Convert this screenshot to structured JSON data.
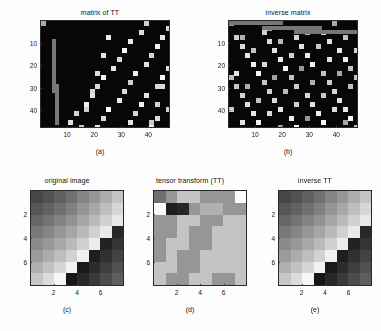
{
  "figure": {
    "background": "#fdfdfd",
    "panels": [
      {
        "id": "a",
        "title": "matrix of TT",
        "caption": "(a)"
      },
      {
        "id": "b",
        "title": "inverse matrix",
        "caption": "(b)"
      },
      {
        "id": "c",
        "title": "original image",
        "caption": "(c)"
      },
      {
        "id": "d",
        "title": "tensor transform (TT)",
        "caption": "(d)"
      },
      {
        "id": "e",
        "title": "inverse TT",
        "caption": "(e)"
      }
    ]
  },
  "chart_data": [
    {
      "type": "heatmap",
      "id": "a",
      "title": "matrix of TT",
      "caption": "(a)",
      "xlabel": "",
      "ylabel": "",
      "xticks": [
        10,
        20,
        30,
        40
      ],
      "yticks": [
        10,
        20,
        30,
        40
      ],
      "xlim": [
        0,
        48
      ],
      "ylim": [
        0,
        48
      ],
      "grid": false,
      "colormap": "gray",
      "background_value": 0,
      "description": "Sparse binary 48x48 transform matrix: bright dots on black background arranged in nested chevron / V-shaped diagonal bands, with a broken vertical gray streak down the left-most columns.",
      "size": [
        48,
        48
      ]
    },
    {
      "type": "heatmap",
      "id": "b",
      "title": "inverse matrix",
      "caption": "(b)",
      "xlabel": "",
      "ylabel": "",
      "xticks": [
        10,
        20,
        30,
        40
      ],
      "yticks": [
        10,
        20,
        30,
        40
      ],
      "xlim": [
        0,
        48
      ],
      "ylim": [
        0,
        48
      ],
      "grid": false,
      "colormap": "gray",
      "background_value": 0,
      "description": "Sparse 48x48 inverse transform matrix: descending staircase of horizontal gray bars across the top rows, repeated parallel diagonal dot stripes below, and a short bright vertical white line near column 43 at the bottom.",
      "size": [
        48,
        48
      ]
    },
    {
      "type": "heatmap",
      "id": "c",
      "title": "original image",
      "caption": "(c)",
      "xlabel": "",
      "ylabel": "",
      "xticks": [
        2,
        4,
        6
      ],
      "yticks": [
        2,
        4,
        6
      ],
      "xlim": [
        0,
        8
      ],
      "ylim": [
        0,
        8
      ],
      "grid": false,
      "colormap": "gray",
      "vmin": 0,
      "vmax": 255,
      "size": [
        8,
        8
      ],
      "values": [
        [
          70,
          82,
          96,
          112,
          132,
          150,
          172,
          196
        ],
        [
          86,
          98,
          112,
          128,
          148,
          168,
          190,
          214
        ],
        [
          102,
          116,
          130,
          146,
          166,
          186,
          208,
          232
        ],
        [
          120,
          134,
          150,
          166,
          186,
          208,
          234,
          40
        ],
        [
          138,
          152,
          168,
          186,
          208,
          236,
          34,
          52
        ],
        [
          156,
          172,
          190,
          210,
          240,
          30,
          48,
          66
        ],
        [
          176,
          194,
          214,
          242,
          26,
          44,
          62,
          80
        ],
        [
          198,
          220,
          246,
          22,
          40,
          58,
          76,
          94
        ]
      ]
    },
    {
      "type": "heatmap",
      "id": "d",
      "title": "tensor transform (TT)",
      "caption": "(d)",
      "xlabel": "",
      "ylabel": "",
      "xticks": [
        2,
        4,
        6
      ],
      "yticks": [
        2,
        4,
        6
      ],
      "xlim": [
        0,
        8
      ],
      "ylim": [
        0,
        8
      ],
      "grid": false,
      "colormap": "gray",
      "vmin": 0,
      "vmax": 255,
      "size": [
        8,
        8
      ],
      "values": [
        [
          112,
          150,
          196,
          196,
          150,
          150,
          150,
          252
        ],
        [
          250,
          30,
          38,
          150,
          176,
          176,
          150,
          150
        ],
        [
          150,
          150,
          196,
          196,
          150,
          150,
          196,
          196
        ],
        [
          150,
          150,
          196,
          150,
          150,
          196,
          196,
          196
        ],
        [
          150,
          196,
          196,
          150,
          150,
          196,
          196,
          196
        ],
        [
          150,
          196,
          150,
          150,
          196,
          196,
          196,
          196
        ],
        [
          196,
          196,
          150,
          150,
          196,
          196,
          196,
          196
        ],
        [
          196,
          150,
          150,
          196,
          196,
          150,
          150,
          196
        ]
      ]
    },
    {
      "type": "heatmap",
      "id": "e",
      "title": "inverse TT",
      "caption": "(e)",
      "xlabel": "",
      "ylabel": "",
      "xticks": [
        2,
        4,
        6
      ],
      "yticks": [
        2,
        4,
        6
      ],
      "xlim": [
        0,
        8
      ],
      "ylim": [
        0,
        8
      ],
      "grid": false,
      "colormap": "gray",
      "vmin": 0,
      "vmax": 255,
      "size": [
        8,
        8
      ],
      "values": [
        [
          70,
          82,
          96,
          112,
          132,
          150,
          172,
          196
        ],
        [
          86,
          98,
          112,
          128,
          148,
          168,
          190,
          214
        ],
        [
          102,
          116,
          130,
          146,
          166,
          186,
          208,
          232
        ],
        [
          120,
          134,
          150,
          166,
          186,
          208,
          234,
          40
        ],
        [
          138,
          152,
          168,
          186,
          208,
          236,
          34,
          52
        ],
        [
          156,
          172,
          190,
          210,
          240,
          30,
          48,
          66
        ],
        [
          176,
          194,
          214,
          242,
          26,
          44,
          62,
          80
        ],
        [
          198,
          220,
          246,
          22,
          40,
          58,
          76,
          94
        ]
      ]
    }
  ]
}
